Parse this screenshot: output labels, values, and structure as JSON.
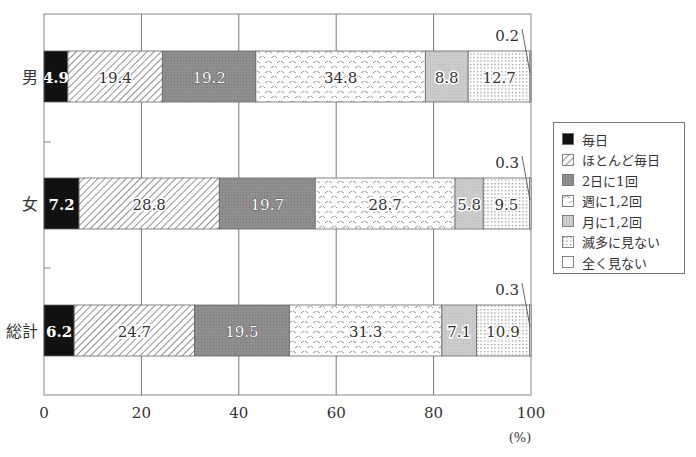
{
  "chart_data": {
    "type": "bar",
    "orientation": "horizontal",
    "stacked": true,
    "title": "",
    "xlabel": "(%)",
    "ylabel": "",
    "xlim": [
      0,
      100
    ],
    "x_ticks": [
      "0",
      "20",
      "40",
      "60",
      "80",
      "100"
    ],
    "grid": true,
    "legend_position": "right",
    "categories": [
      "男",
      "女",
      "総計"
    ],
    "series": [
      {
        "name": "毎日",
        "pattern": "solid-black",
        "values": [
          4.9,
          7.2,
          6.2
        ]
      },
      {
        "name": "ほとんど毎日",
        "pattern": "diagonal-hatch",
        "values": [
          19.4,
          28.8,
          24.7
        ]
      },
      {
        "name": "2日に1回",
        "pattern": "dark-gray",
        "values": [
          19.2,
          19.7,
          19.5
        ]
      },
      {
        "name": "週に1,2回",
        "pattern": "zigzag-dash",
        "values": [
          34.8,
          28.7,
          31.3
        ]
      },
      {
        "name": "月に1,2回",
        "pattern": "light-gray",
        "values": [
          8.8,
          5.8,
          7.1
        ]
      },
      {
        "name": "滅多に見ない",
        "pattern": "dotted",
        "values": [
          12.7,
          9.5,
          10.9
        ]
      },
      {
        "name": "全く見ない",
        "pattern": "white",
        "values": [
          0.2,
          0.3,
          0.3
        ]
      }
    ],
    "annotations": [
      {
        "category": "男",
        "text": "0.2",
        "series": "全く見ない"
      },
      {
        "category": "女",
        "text": "0.3",
        "series": "全く見ない"
      },
      {
        "category": "総計",
        "text": "0.3",
        "series": "全く見ない"
      }
    ]
  },
  "legend": {
    "items": [
      {
        "label": "毎日"
      },
      {
        "label": "ほとんど毎日"
      },
      {
        "label": "2日に1回"
      },
      {
        "label": "週に1,2回"
      },
      {
        "label": "月に1,2回"
      },
      {
        "label": "滅多に見ない"
      },
      {
        "label": "全く見ない"
      }
    ]
  },
  "axis": {
    "unit_label": "(%)"
  },
  "colors": {
    "solid_black": "#111111",
    "dark_gray": "#8c8c8c",
    "light_gray": "#c8c8c8",
    "grid": "#777777",
    "text": "#333333"
  }
}
